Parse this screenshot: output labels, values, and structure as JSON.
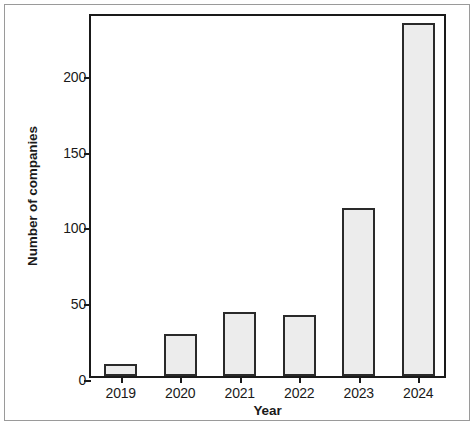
{
  "chart_data": {
    "type": "bar",
    "title": "",
    "subtitle": "",
    "xlabel": "Year",
    "ylabel": "Number of companies",
    "categories": [
      "2019",
      "2020",
      "2021",
      "2022",
      "2023",
      "2024"
    ],
    "values": [
      8,
      28,
      42,
      40,
      111,
      233
    ],
    "series": [
      {
        "name": "Number of companies",
        "values": [
          8,
          28,
          42,
          40,
          111,
          233
        ]
      }
    ],
    "ylim": [
      0,
      240
    ],
    "xlim": [
      0,
      6
    ],
    "yticks": [
      0,
      50,
      100,
      150,
      200
    ],
    "ytick_labels": [
      "0",
      "50",
      "100",
      "150",
      "200"
    ],
    "xtick_labels": [
      "2019",
      "2020",
      "2021",
      "2022",
      "2023",
      "2024"
    ],
    "grid": false,
    "legend": false,
    "legend_position": "none",
    "annotations": [],
    "colors": {
      "bar_fill": "#ececec",
      "bar_edge": "#2a2a2a",
      "axis": "#1a1a1a",
      "frame": "#9a9a9a",
      "background": "#ffffff",
      "text": "#1a1a1a"
    }
  }
}
